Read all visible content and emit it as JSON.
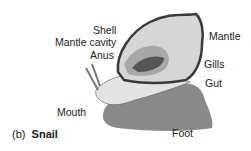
{
  "figure": {
    "caption_letter": "(b)",
    "caption_title": "Snail",
    "labels": {
      "shell": "Shell",
      "mantle_cavity": "Mantle cavity",
      "anus": "Anus",
      "mantle": "Mantle",
      "gills": "Gills",
      "gut": "Gut",
      "mouth": "Mouth",
      "foot": "Foot"
    },
    "colors": {
      "shell_outline": "#3a3a3a",
      "shell_fill": "#d6d6d6",
      "body_fill": "#e4e4e4",
      "foot_fill": "#8a8a8a",
      "gill_fill": "#555555",
      "cavity_fill": "#a8a8a8"
    }
  }
}
